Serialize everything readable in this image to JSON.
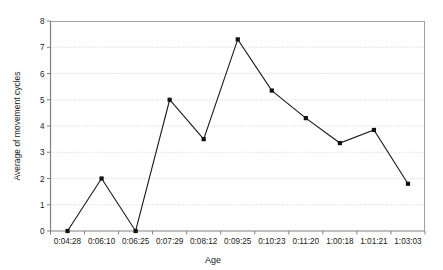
{
  "chart_data": {
    "type": "line",
    "title": "",
    "xlabel": "Age",
    "ylabel": "Average of movement cycles",
    "categories": [
      "0:04:28",
      "0:06:10",
      "0:06:25",
      "0:07:29",
      "0:08:12",
      "0:09:25",
      "0:10:23",
      "0:11:20",
      "1:00:18",
      "1:01:21",
      "1:03:03"
    ],
    "values": [
      0,
      2.0,
      0,
      5.0,
      3.5,
      7.3,
      5.35,
      4.3,
      3.35,
      3.85,
      1.8
    ],
    "ylim": [
      0,
      8
    ],
    "yticks": [
      "0",
      "1",
      "2",
      "3",
      "4",
      "5",
      "6",
      "7",
      "8"
    ],
    "grid": true,
    "grid_axis": "y",
    "legend": "none",
    "series_color": "#1a1a1a",
    "marker": "square",
    "marker_color": "#111111",
    "grid_color": "#c8c8c8",
    "axis_color": "#808080"
  }
}
